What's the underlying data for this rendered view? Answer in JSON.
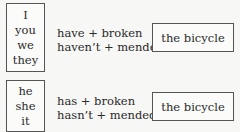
{
  "rows": [
    {
      "pronouns": [
        "I",
        "you",
        "we",
        "they"
      ],
      "verbs": [
        "have + broken",
        "haven’t + mended"
      ],
      "object": "the bicycle"
    },
    {
      "pronouns": [
        "he",
        "she",
        "it"
      ],
      "verbs": [
        "has + broken",
        "hasn’t + mended"
      ],
      "object": "the bicycle"
    }
  ]
}
